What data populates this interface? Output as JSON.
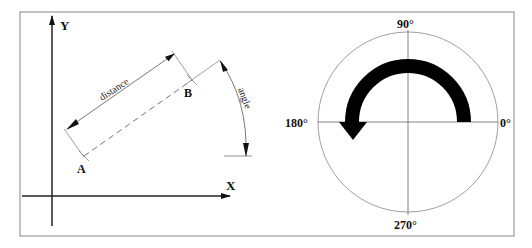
{
  "left_panel": {
    "axis_y_label": "Y",
    "axis_x_label": "X",
    "point_a_label": "A",
    "point_b_label": "B",
    "distance_label": "distance",
    "angle_label": "angle"
  },
  "right_panel": {
    "label_90": "90°",
    "label_180": "180°",
    "label_0": "0°",
    "label_270": "270°",
    "arrow_direction": "counter-clockwise from 0° to 180°"
  },
  "colors": {
    "frame": "#888888",
    "line": "#222222",
    "thin_line": "#777777",
    "arrow_fill": "#000000"
  }
}
